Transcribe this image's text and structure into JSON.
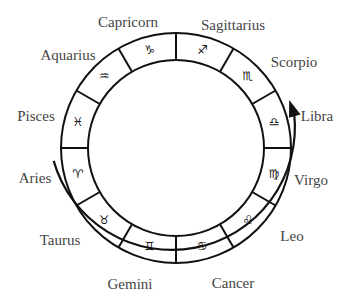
{
  "diagram": {
    "center": [
      176,
      148
    ],
    "outer_radius": 115,
    "inner_radius": 88,
    "arrow_radius": 123,
    "arrow_start_deg": 186,
    "arrow_end_deg": 20,
    "stroke_color": "#111111",
    "label_color": "#444444",
    "signs": [
      {
        "name": "Capricorn",
        "symbol": "♑",
        "mid_deg": 105,
        "label_pos": [
          128,
          22
        ]
      },
      {
        "name": "Sagittarius",
        "symbol": "♐",
        "mid_deg": 75,
        "label_pos": [
          233,
          25
        ]
      },
      {
        "name": "Scorpio",
        "symbol": "♏",
        "mid_deg": 45,
        "label_pos": [
          294,
          62
        ]
      },
      {
        "name": "Libra",
        "symbol": "♎",
        "mid_deg": 15,
        "label_pos": [
          317,
          116
        ]
      },
      {
        "name": "Virgo",
        "symbol": "♍",
        "mid_deg": -15,
        "label_pos": [
          311,
          180
        ]
      },
      {
        "name": "Leo",
        "symbol": "♌",
        "mid_deg": -45,
        "label_pos": [
          292,
          236
        ]
      },
      {
        "name": "Cancer",
        "symbol": "♋",
        "mid_deg": -75,
        "label_pos": [
          233,
          283
        ]
      },
      {
        "name": "Gemini",
        "symbol": "♊",
        "mid_deg": -105,
        "label_pos": [
          130,
          284
        ]
      },
      {
        "name": "Taurus",
        "symbol": "♉",
        "mid_deg": -135,
        "label_pos": [
          60,
          240
        ]
      },
      {
        "name": "Aries",
        "symbol": "♈",
        "mid_deg": -165,
        "label_pos": [
          35,
          178
        ]
      },
      {
        "name": "Pisces",
        "symbol": "♓",
        "mid_deg": 165,
        "label_pos": [
          36,
          116
        ]
      },
      {
        "name": "Aquarius",
        "symbol": "♒",
        "mid_deg": 135,
        "label_pos": [
          68,
          55
        ]
      }
    ]
  }
}
